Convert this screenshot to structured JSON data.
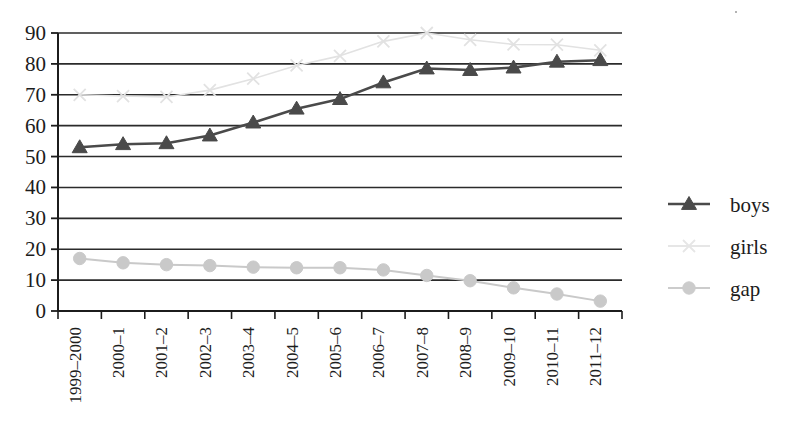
{
  "chart_data": {
    "type": "line",
    "title": "",
    "subtitle": "",
    "xlabel": "",
    "ylabel": "",
    "ylim": [
      0,
      90
    ],
    "ytick_step": 10,
    "yticks": [
      0,
      10,
      20,
      30,
      40,
      50,
      60,
      70,
      80,
      90
    ],
    "grid": true,
    "grid_axis": "y",
    "legend_position": "right",
    "categories": [
      "1999–2000",
      "2000–1",
      "2001–2",
      "2002–3",
      "2003–4",
      "2004–5",
      "2005–6",
      "2006–7",
      "2007–8",
      "2008–9",
      "2009–10",
      "2010–11",
      "2011–12"
    ],
    "series": [
      {
        "name": "boys",
        "color": "#4a4a4a",
        "marker": "triangle",
        "values": [
          53,
          54,
          54.3,
          56.8,
          61,
          65.5,
          68.6,
          74,
          78.5,
          78,
          78.8,
          80.7,
          81.2
        ]
      },
      {
        "name": "girls",
        "color": "#e2e2e2",
        "marker": "x",
        "values": [
          70,
          69.6,
          69.3,
          71.5,
          75.2,
          79.5,
          82.6,
          87.3,
          90,
          87.8,
          86.3,
          86.2,
          84.4
        ]
      },
      {
        "name": "gap",
        "color": "#c9c9c9",
        "marker": "circle",
        "values": [
          17,
          15.6,
          15,
          14.7,
          14.2,
          14,
          14,
          13.3,
          11.5,
          9.8,
          7.5,
          5.5,
          3.2
        ]
      }
    ]
  },
  "legend": {
    "items": [
      {
        "label": "boys",
        "marker": "triangle",
        "color": "#4a4a4a"
      },
      {
        "label": "girls",
        "marker": "x",
        "color": "#e6e6e6"
      },
      {
        "label": "gap",
        "marker": "circle",
        "color": "#cccccc"
      }
    ]
  },
  "axes": {
    "y_tick_labels": [
      "90",
      "80",
      "70",
      "60",
      "50",
      "40",
      "30",
      "20",
      "10",
      "0"
    ],
    "x_tick_labels": [
      "1999–2000",
      "2000–1",
      "2001–2",
      "2002–3",
      "2003–4",
      "2004–5",
      "2005–6",
      "2006–7",
      "2007–8",
      "2008–9",
      "2009–10",
      "2010–11",
      "2011–12"
    ]
  },
  "colors": {
    "axis": "#1c1c1c",
    "grid": "#2b2b2b",
    "boys": "#4a4a4a",
    "girls": "#e4e4e4",
    "gap": "#c9c9c9",
    "background": "#ffffff"
  }
}
